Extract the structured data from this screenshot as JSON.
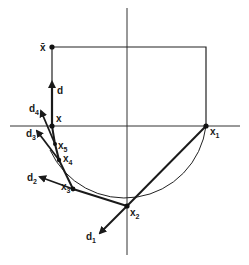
{
  "diagram": {
    "points": {
      "xbar": {
        "label": "x̄",
        "x": 52,
        "y": 47
      },
      "x": {
        "label": "x",
        "x": 52,
        "y": 126
      },
      "x1": {
        "label": "x",
        "sub": "1",
        "x": 206,
        "y": 126
      },
      "x2": {
        "label": "x",
        "sub": "2",
        "x": 127,
        "y": 206
      },
      "x3": {
        "label": "x",
        "sub": "3",
        "x": 73,
        "y": 189
      },
      "x4": {
        "label": "x",
        "sub": "4",
        "x": 59,
        "y": 160
      },
      "x5": {
        "label": "x",
        "sub": "5",
        "x": 55,
        "y": 144
      }
    },
    "directions": {
      "d": {
        "label": "d"
      },
      "d1": {
        "label": "d",
        "sub": "1"
      },
      "d2": {
        "label": "d",
        "sub": "2"
      },
      "d3": {
        "label": "d",
        "sub": "3"
      },
      "d4": {
        "label": "d",
        "sub": "4"
      }
    }
  }
}
